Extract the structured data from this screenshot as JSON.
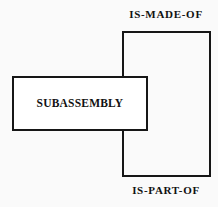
{
  "diagram": {
    "background_color": "#fafafa",
    "line_color": "#161616",
    "fill_color": "#ffffff",
    "text_color": "#111111",
    "entity": {
      "label": "SUBASSEMBLY",
      "shape": "rectangle",
      "x": 12,
      "y": 76,
      "width": 136,
      "height": 55
    },
    "relationship_box": {
      "shape": "rectangle",
      "x": 122,
      "y": 31,
      "width": 89,
      "height": 146
    },
    "relations": [
      {
        "label": "IS-MADE-OF",
        "position": "top"
      },
      {
        "label": "IS-PART-OF",
        "position": "bottom"
      }
    ]
  }
}
